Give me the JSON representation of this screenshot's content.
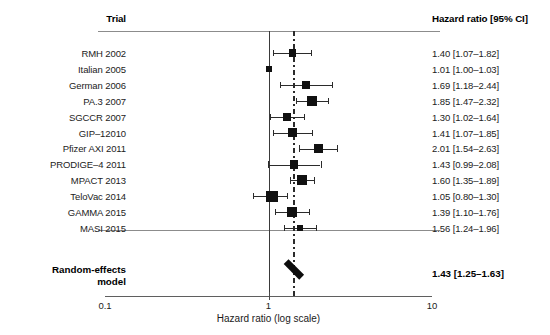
{
  "header": {
    "trial_column": "Trial",
    "hr_column": "Hazard ratio [95% CI]"
  },
  "axis": {
    "title": "Hazard ratio (log scale)",
    "tick_labels": [
      "0.1",
      "1",
      "10"
    ],
    "tick_values": [
      0.1,
      1,
      10
    ],
    "scale": "log",
    "xmin": 0.1,
    "xmax": 10
  },
  "pooled": {
    "label_line1": "Random-effects",
    "label_line2": "model",
    "hr_text": "1.43 [1.25–1.63]",
    "estimate": 1.43,
    "ci_low": 1.25,
    "ci_high": 1.63
  },
  "colors": {
    "marker": "#111111",
    "line": "#2b2b2b",
    "rule": "#8c8c8c",
    "text": "#1a1a1a"
  },
  "chart_data": {
    "type": "forest",
    "title": "",
    "xlabel": "Hazard ratio (log scale)",
    "ylabel": "",
    "xscale": "log",
    "xlim": [
      0.1,
      10
    ],
    "xticks": [
      0.1,
      1,
      10
    ],
    "xticklabels": [
      "0.1",
      "1",
      "10"
    ],
    "reference_line": 1,
    "pooled_line": 1.43,
    "grid": false,
    "legend": "none",
    "columns": [
      "Trial",
      "Hazard ratio [95% CI]"
    ],
    "studies": [
      {
        "trial": "RMH 2002",
        "hr": 1.4,
        "ci_low": 1.07,
        "ci_high": 1.82,
        "hr_text": "1.40 [1.07–1.82]",
        "weight": 0.42
      },
      {
        "trial": "Italian 2005",
        "hr": 1.01,
        "ci_low": 1.0,
        "ci_high": 1.03,
        "hr_text": "1.01 [1.00–1.03]",
        "weight": 0.18
      },
      {
        "trial": "German 2006",
        "hr": 1.69,
        "ci_low": 1.18,
        "ci_high": 2.44,
        "hr_text": "1.69 [1.18–2.44]",
        "weight": 0.4
      },
      {
        "trial": "PA.3 2007",
        "hr": 1.85,
        "ci_low": 1.47,
        "ci_high": 2.32,
        "hr_text": "1.85 [1.47–2.32]",
        "weight": 0.64
      },
      {
        "trial": "SGCCR 2007",
        "hr": 1.3,
        "ci_low": 1.02,
        "ci_high": 1.64,
        "hr_text": "1.30 [1.02–1.64]",
        "weight": 0.5
      },
      {
        "trial": "GIP–12010",
        "hr": 1.41,
        "ci_low": 1.07,
        "ci_high": 1.85,
        "hr_text": "1.41 [1.07–1.85]",
        "weight": 0.56
      },
      {
        "trial": "Pfizer AXI 2011",
        "hr": 2.01,
        "ci_low": 1.54,
        "ci_high": 2.63,
        "hr_text": "2.01 [1.54–2.63]",
        "weight": 0.58
      },
      {
        "trial": "PRODIGE–4 2011",
        "hr": 1.43,
        "ci_low": 0.99,
        "ci_high": 2.08,
        "hr_text": "1.43 [0.99–2.08]",
        "weight": 0.52
      },
      {
        "trial": "MPACT 2013",
        "hr": 1.6,
        "ci_low": 1.35,
        "ci_high": 1.89,
        "hr_text": "1.60 [1.35–1.89]",
        "weight": 0.7
      },
      {
        "trial": "TeloVac 2014",
        "hr": 1.05,
        "ci_low": 0.8,
        "ci_high": 1.3,
        "hr_text": "1.05 [0.80–1.30]",
        "weight": 0.86
      },
      {
        "trial": "GAMMA 2015",
        "hr": 1.39,
        "ci_low": 1.1,
        "ci_high": 1.76,
        "hr_text": "1.39 [1.10–1.76]",
        "weight": 0.62
      },
      {
        "trial": "MASI 2015",
        "hr": 1.56,
        "ci_low": 1.24,
        "ci_high": 1.96,
        "hr_text": "1.56 [1.24–1.96]",
        "weight": 0.26
      }
    ],
    "summary": {
      "label": "Random-effects model",
      "hr": 1.43,
      "ci_low": 1.25,
      "ci_high": 1.63,
      "hr_text": "1.43 [1.25–1.63]"
    }
  }
}
